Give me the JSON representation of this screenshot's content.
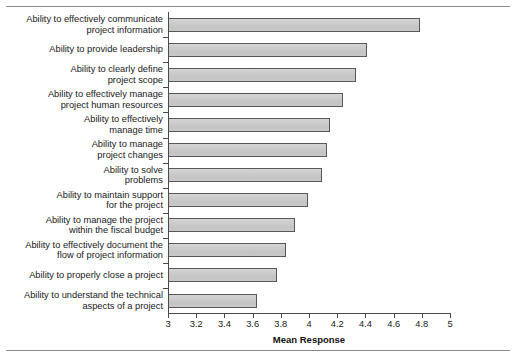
{
  "chart_data": {
    "type": "bar",
    "orientation": "horizontal",
    "title": "",
    "xlabel": "Mean Response",
    "ylabel": "",
    "xlim": [
      3,
      5
    ],
    "xticks": [
      "3",
      "3.2",
      "3.4",
      "3.6",
      "3.8",
      "4",
      "4.2",
      "4.4",
      "4.6",
      "4.8",
      "5"
    ],
    "xtick_values": [
      3,
      3.2,
      3.4,
      3.6,
      3.8,
      4,
      4.2,
      4.4,
      4.6,
      4.8,
      5
    ],
    "grid": false,
    "legend": false,
    "bar_color": "#c9c9c9",
    "bar_edge_color": "#58585a",
    "categories": [
      "Ability to effectively communicate\nproject information",
      "Ability to provide leadership",
      "Ability to clearly define\nproject scope",
      "Ability to effectively manage\nproject human resources",
      "Ability to effectively\nmanage time",
      "Ability to manage\nproject changes",
      "Ability to solve\nproblems",
      "Ability to maintain support\nfor the project",
      "Ability to manage the project\nwithin the fiscal budget",
      "Ability to effectively document the\nflow of project information",
      "Ability to properly close a project",
      "Ability to understand the technical\naspects of a project"
    ],
    "values": [
      4.79,
      4.41,
      4.33,
      4.24,
      4.15,
      4.13,
      4.09,
      3.99,
      3.9,
      3.84,
      3.77,
      3.63
    ]
  }
}
